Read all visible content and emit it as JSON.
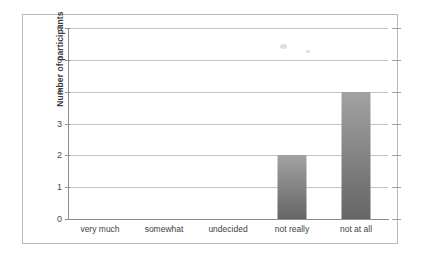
{
  "chart_data": {
    "type": "bar",
    "title": "",
    "xlabel": "",
    "ylabel": "Number of participants",
    "categories": [
      "very much",
      "somewhat",
      "undecided",
      "not really",
      "not at all"
    ],
    "values": [
      0,
      0,
      0,
      2,
      4
    ],
    "ylim": [
      0,
      6
    ],
    "y_ticks": [
      0,
      1,
      2,
      3,
      4,
      5,
      6
    ],
    "y_tick_labels": [
      "0",
      "1",
      "2",
      "3",
      "4",
      "5",
      "6"
    ],
    "grid": true,
    "legend": false,
    "legend_position": "none",
    "series": [
      {
        "name": "Number of participants",
        "values": [
          0,
          0,
          0,
          2,
          4
        ]
      }
    ]
  },
  "style": {
    "bar_color_top": "#a2a2a2",
    "bar_color_bottom": "#666666",
    "gridline_color": "#c4c4c4",
    "axis_color": "#8e8e8e",
    "frame_color": "#b9b9b9",
    "text_color": "#3f3f3f",
    "background": "#ffffff"
  }
}
